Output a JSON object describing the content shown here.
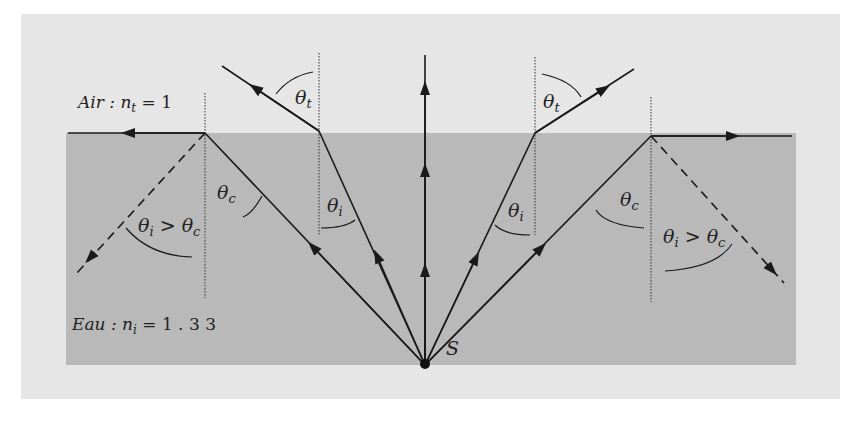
{
  "figure": {
    "labels": {
      "air": "Air : n",
      "air_sub": "t",
      "air_val": " = 1",
      "water": "Eau : n",
      "water_sub": "i",
      "water_val": " = 1 . 3 3",
      "source": "S",
      "theta": "θ",
      "sub_t": "t",
      "sub_i": "i",
      "sub_c": "c",
      "gt": " > "
    },
    "colors": {
      "outer_panel": "#e6e6e6",
      "water": "#b9b9b9",
      "ray": "#1a1a1a"
    }
  }
}
